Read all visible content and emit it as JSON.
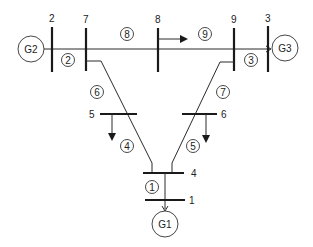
{
  "diagram": {
    "type": "power-system-one-line",
    "buses": [
      {
        "id": "1",
        "label": "1"
      },
      {
        "id": "2",
        "label": "2"
      },
      {
        "id": "3",
        "label": "3"
      },
      {
        "id": "4",
        "label": "4"
      },
      {
        "id": "5",
        "label": "5"
      },
      {
        "id": "6",
        "label": "6"
      },
      {
        "id": "7",
        "label": "7"
      },
      {
        "id": "8",
        "label": "8"
      },
      {
        "id": "9",
        "label": "9"
      }
    ],
    "generators": [
      {
        "label": "G1",
        "bus": "1"
      },
      {
        "label": "G2",
        "bus": "2"
      },
      {
        "label": "G3",
        "bus": "3"
      }
    ],
    "branches": [
      {
        "label": "1",
        "from": "1",
        "to": "4"
      },
      {
        "label": "2",
        "from": "2",
        "to": "7"
      },
      {
        "label": "3",
        "from": "9",
        "to": "3"
      },
      {
        "label": "4",
        "from": "5",
        "to": "4"
      },
      {
        "label": "5",
        "from": "6",
        "to": "4"
      },
      {
        "label": "6",
        "from": "7",
        "to": "5"
      },
      {
        "label": "7",
        "from": "9",
        "to": "6"
      },
      {
        "label": "8",
        "from": "7",
        "to": "8"
      },
      {
        "label": "9",
        "from": "8",
        "to": "9"
      }
    ],
    "loads": [
      "5",
      "6",
      "8"
    ]
  }
}
